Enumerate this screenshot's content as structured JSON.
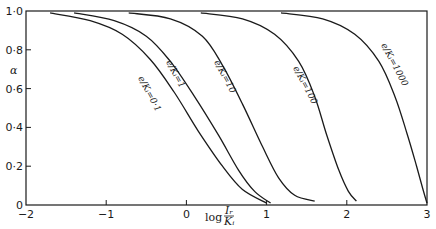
{
  "chart_data": {
    "type": "line",
    "title": "",
    "xlabel": "log (Ir / Ki)",
    "ylabel": "α",
    "xlim": [
      -2,
      3
    ],
    "ylim": [
      0,
      1.0
    ],
    "x_ticks": [
      "-2",
      "-1",
      "0",
      "1",
      "2",
      "3"
    ],
    "y_ticks": [
      "0",
      "0·2",
      "0·4",
      "0·6",
      "0·8",
      "1·0"
    ],
    "grid": false,
    "legend": "inline curve labels",
    "series": [
      {
        "name": "e/Ki = 0·1",
        "x": [
          -1.7,
          -1.2,
          -0.8,
          -0.45,
          -0.15,
          0.15,
          0.45,
          0.7,
          1.0
        ],
        "y": [
          0.99,
          0.95,
          0.88,
          0.75,
          0.58,
          0.38,
          0.2,
          0.08,
          0.01
        ]
      },
      {
        "name": "e/Ki = 1",
        "x": [
          -1.4,
          -0.9,
          -0.5,
          -0.2,
          0.1,
          0.4,
          0.65,
          0.85,
          1.05
        ],
        "y": [
          0.99,
          0.95,
          0.87,
          0.74,
          0.56,
          0.36,
          0.18,
          0.07,
          0.01
        ]
      },
      {
        "name": "e/Ki = 10",
        "x": [
          -0.72,
          -0.2,
          0.2,
          0.45,
          0.7,
          0.95,
          1.15,
          1.35,
          1.6
        ],
        "y": [
          0.99,
          0.96,
          0.87,
          0.72,
          0.52,
          0.3,
          0.14,
          0.05,
          0.02
        ]
      },
      {
        "name": "e/Ki = 100",
        "x": [
          0.18,
          0.7,
          1.1,
          1.4,
          1.6,
          1.75,
          1.9,
          2.02,
          2.12
        ],
        "y": [
          0.99,
          0.96,
          0.88,
          0.74,
          0.56,
          0.36,
          0.18,
          0.07,
          0.02
        ]
      },
      {
        "name": "e/Ki = 1000",
        "x": [
          1.18,
          1.7,
          2.1,
          2.4,
          2.6,
          2.75,
          2.87,
          2.95,
          3.0
        ],
        "y": [
          0.99,
          0.96,
          0.88,
          0.74,
          0.56,
          0.37,
          0.2,
          0.08,
          0.01
        ]
      }
    ]
  },
  "labels": {
    "y_axis": "α",
    "x_axis_prefix": "log",
    "x_axis_num": "Iᵣ",
    "x_axis_den": "Kᵢ",
    "curves": [
      "e/Kᵢ=0·1",
      "e/Kᵢ=1",
      "e/Kᵢ=10",
      "e/Kᵢ=100",
      "e/Kᵢ=1000"
    ]
  }
}
